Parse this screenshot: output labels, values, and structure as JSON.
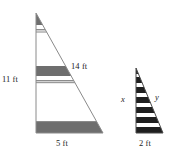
{
  "figure": {
    "type": "geometry-diagram",
    "colors": {
      "outline": "#7a7a7a",
      "band_dark": "#6e6e6e",
      "band_dark_small": "#1f1f1f",
      "background": "#ffffff",
      "text": "#1c1c1c"
    },
    "large_triangle": {
      "name": "large-triangle",
      "apex": {
        "x": 36,
        "y": 13
      },
      "bottom_left": {
        "x": 36,
        "y": 133
      },
      "bottom_right": {
        "x": 103,
        "y": 133
      },
      "labels": {
        "leg_left": "11 ft",
        "hypotenuse": "14 ft",
        "base": "5 ft"
      },
      "bands": [
        {
          "top": 14,
          "bottom": 25,
          "shade": "dark"
        },
        {
          "top": 25,
          "bottom": 29,
          "shade": "light"
        },
        {
          "top": 29,
          "bottom": 32,
          "shade": "rule"
        },
        {
          "top": 66,
          "bottom": 76,
          "shade": "dark"
        },
        {
          "top": 76,
          "bottom": 80,
          "shade": "light"
        },
        {
          "top": 80,
          "bottom": 83,
          "shade": "rule"
        },
        {
          "top": 121,
          "bottom": 133,
          "shade": "dark"
        }
      ]
    },
    "small_triangle": {
      "name": "small-triangle",
      "apex": {
        "x": 136,
        "y": 68
      },
      "bottom_left": {
        "x": 136,
        "y": 133
      },
      "bottom_right": {
        "x": 163,
        "y": 133
      },
      "labels": {
        "leg_left": "x",
        "hypotenuse": "y",
        "base": "2 ft"
      },
      "stripe_count": 9,
      "stripes": [
        {
          "top": 68,
          "bottom": 74,
          "shade": "dark"
        },
        {
          "top": 74,
          "bottom": 77,
          "shade": "light"
        },
        {
          "top": 77,
          "bottom": 83,
          "shade": "dark"
        },
        {
          "top": 83,
          "bottom": 87,
          "shade": "light"
        },
        {
          "top": 87,
          "bottom": 93,
          "shade": "dark"
        },
        {
          "top": 93,
          "bottom": 97,
          "shade": "light"
        },
        {
          "top": 97,
          "bottom": 103,
          "shade": "dark"
        },
        {
          "top": 103,
          "bottom": 107,
          "shade": "light"
        },
        {
          "top": 107,
          "bottom": 113,
          "shade": "dark"
        },
        {
          "top": 113,
          "bottom": 117,
          "shade": "light"
        },
        {
          "top": 117,
          "bottom": 123,
          "shade": "dark"
        },
        {
          "top": 123,
          "bottom": 127,
          "shade": "light"
        },
        {
          "top": 127,
          "bottom": 133,
          "shade": "dark"
        }
      ]
    }
  }
}
